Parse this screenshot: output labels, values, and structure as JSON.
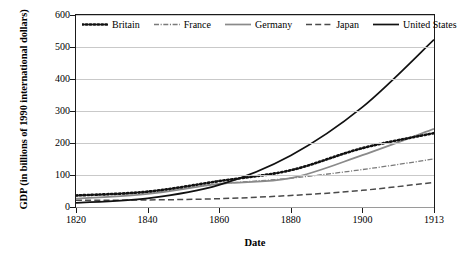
{
  "chart_data": {
    "type": "line",
    "title": "",
    "xlabel": "Date",
    "ylabel": "GDP (in billions of 1990 international dollars)",
    "x": [
      1820,
      1840,
      1860,
      1880,
      1900,
      1913
    ],
    "xtick_labels": [
      "1820",
      "1840",
      "1860",
      "1880",
      "1900",
      "1913"
    ],
    "ytick_labels": [
      "0",
      "100",
      "200",
      "300",
      "400",
      "500",
      "600"
    ],
    "yticks": [
      0,
      100,
      200,
      300,
      400,
      500,
      600
    ],
    "ylim": [
      0,
      600
    ],
    "grid": true,
    "legend_position": "top-inside",
    "series": [
      {
        "name": "Britain",
        "style": "dotted",
        "color": "#111111",
        "values": [
          36,
          48,
          81,
          115,
          184,
          231
        ]
      },
      {
        "name": "France",
        "style": "dash-dot",
        "color": "#7a7a7a",
        "values": [
          35,
          45,
          72,
          90,
          117,
          150
        ]
      },
      {
        "name": "Germany",
        "style": "solid",
        "color": "#8a8a8a",
        "values": [
          26,
          41,
          72,
          90,
          162,
          244
        ]
      },
      {
        "name": "Japan",
        "style": "dashed",
        "color": "#4a4a4a",
        "values": [
          21,
          22,
          26,
          36,
          52,
          77
        ]
      },
      {
        "name": "United States",
        "style": "solid",
        "color": "#111111",
        "values": [
          13,
          27,
          69,
          161,
          312,
          523
        ]
      }
    ]
  }
}
